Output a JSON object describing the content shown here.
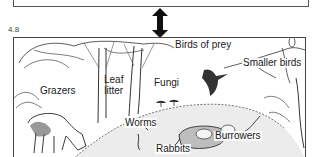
{
  "figure": {
    "number": "4.8",
    "arrow": "double-headed-vertical-arrow"
  },
  "labels": {
    "birds_of_prey": "Birds of prey",
    "smaller_birds": "Smaller birds",
    "grazers": "Grazers",
    "leaf_line1": "Leaf",
    "leaf_line2": "litter",
    "fungi": "Fungi",
    "worms": "Worms",
    "rabbits": "Rabbits",
    "burrowers": "Burrowers"
  },
  "colors": {
    "ink": "#222222",
    "border": "#444444",
    "ground_shade": "#d9d9d9"
  }
}
